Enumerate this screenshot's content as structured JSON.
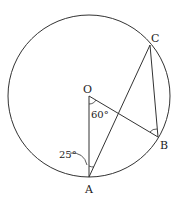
{
  "diagram": {
    "type": "circle-geometry",
    "center": {
      "label": "O",
      "x": 89,
      "y": 96
    },
    "radius": 81,
    "points": [
      {
        "label": "A",
        "x": 89,
        "y": 177
      },
      {
        "label": "B",
        "x": 158,
        "y": 137
      },
      {
        "label": "C",
        "x": 150,
        "y": 45
      }
    ],
    "segments": [
      "OA",
      "OB",
      "AC",
      "BC"
    ],
    "angles": [
      {
        "vertex": "O",
        "between": "AO-OB",
        "value": "60°"
      },
      {
        "vertex": "A",
        "between": "OA-AC",
        "value": "25°"
      },
      {
        "vertex": "B",
        "between": "OB-BC",
        "value": ""
      }
    ]
  },
  "labels": {
    "O": "O",
    "A": "A",
    "B": "B",
    "C": "C",
    "angle_O": "60°",
    "angle_A": "25°"
  },
  "colors": {
    "stroke": "#333333",
    "background": "#ffffff"
  }
}
